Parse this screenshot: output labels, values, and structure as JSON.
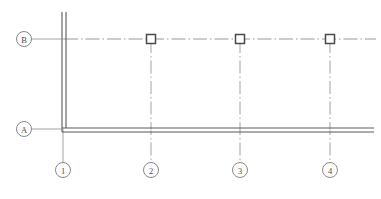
{
  "drawing": {
    "title": "Structural Framing Plan Fragment",
    "type": "architectural-plan",
    "width": 381,
    "height": 199,
    "background_color": "#ffffff",
    "line_color": "#6b6b6b",
    "wall_color": "#5a5a5a",
    "grid_line_color": "#8c8c8c",
    "column_color": "#4a4a4a",
    "bubble_stroke_color": "#7a7a7a",
    "text_color": "#4a4a4a"
  },
  "grid_bubbles_horizontal": [
    {
      "label": "B",
      "cx": 24,
      "cy": 39,
      "r": 7.5,
      "leader_from_x": 31.5,
      "leader_to_x": 64
    },
    {
      "label": "A",
      "cx": 24,
      "cy": 129,
      "r": 7.5,
      "leader_from_x": 31.5,
      "leader_to_x": 64
    }
  ],
  "grid_bubbles_vertical": [
    {
      "label": "1",
      "cx": 63,
      "cy": 170,
      "r": 7.5,
      "leader_from_y": 130,
      "leader_to_y": 162.5
    },
    {
      "label": "2",
      "cx": 151,
      "cy": 170,
      "r": 7.5,
      "leader_from_y": 40,
      "leader_to_y": 162.5
    },
    {
      "label": "3",
      "cx": 240,
      "cy": 170,
      "r": 7.5,
      "leader_from_y": 40,
      "leader_to_y": 162.5
    },
    {
      "label": "4",
      "cx": 330,
      "cy": 170,
      "r": 7.5,
      "leader_from_y": 40,
      "leader_to_y": 162.5
    }
  ],
  "grid_lines": [
    {
      "name": "grid-line-B",
      "orientation": "horizontal",
      "y": 39,
      "x1": 64,
      "x2": 376,
      "style": "dash-dot"
    }
  ],
  "columns": [
    {
      "name": "column-B2",
      "cx": 151,
      "cy": 39,
      "size": 9
    },
    {
      "name": "column-B3",
      "cx": 240,
      "cy": 39,
      "size": 9
    },
    {
      "name": "column-B4",
      "cx": 330,
      "cy": 39,
      "size": 9
    }
  ],
  "walls": [
    {
      "name": "wall-vertical-grid-1",
      "orientation": "vertical",
      "x_outer": 62,
      "x_inner": 66,
      "y_top": 12,
      "y_bottom": 132
    },
    {
      "name": "wall-horizontal-grid-A",
      "orientation": "horizontal",
      "y_outer": 128,
      "y_inner": 132,
      "x_left": 62,
      "x_right": 374,
      "centerline_style": "dash-dot"
    }
  ]
}
